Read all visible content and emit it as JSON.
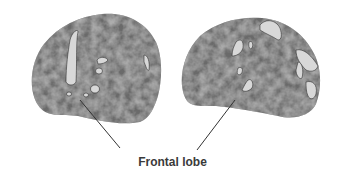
{
  "figure": {
    "label": "Frontal lobe",
    "colors": {
      "brain_surface": "#6e6e6e",
      "brain_dark": "#555555",
      "activation_patch": "#d8d8d8",
      "patch_outline": "#333333",
      "leader_line": "#333333",
      "label_text": "#3a3a3a"
    },
    "panels": [
      {
        "name": "left-brain-render",
        "view": "left lateral"
      },
      {
        "name": "right-brain-render",
        "view": "lateral"
      }
    ]
  }
}
